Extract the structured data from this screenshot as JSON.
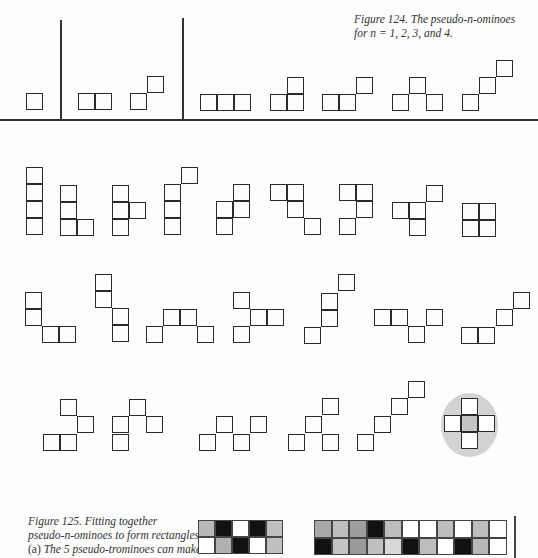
{
  "figure124": {
    "caption_line1": "Figure 124. The pseudo-n-ominoes",
    "caption_line2": "for n = 1, 2, 3, and 4.",
    "groups": [
      {
        "n": 1,
        "pieces": [
          [
            [
              26,
              93
            ]
          ]
        ]
      },
      {
        "n": 2,
        "pieces": [
          [
            [
              78,
              93
            ],
            [
              95,
              93
            ]
          ],
          [
            [
              130,
              93
            ],
            [
              147,
              76
            ]
          ]
        ]
      },
      {
        "n": 3,
        "pieces": [
          [
            [
              200,
              94
            ],
            [
              217,
              94
            ],
            [
              234,
              94
            ]
          ],
          [
            [
              270,
              94
            ],
            [
              287,
              94
            ],
            [
              287,
              77
            ]
          ],
          [
            [
              322,
              94
            ],
            [
              339,
              94
            ],
            [
              356,
              77
            ]
          ],
          [
            [
              392,
              94
            ],
            [
              409,
              77
            ],
            [
              426,
              94
            ]
          ],
          [
            [
              462,
              94
            ],
            [
              479,
              77
            ],
            [
              496,
              60
            ]
          ]
        ]
      }
    ],
    "tetrominoes_row1": [
      [
        [
          26,
          167
        ],
        [
          26,
          184
        ],
        [
          26,
          201
        ],
        [
          26,
          218
        ]
      ],
      [
        [
          60,
          185
        ],
        [
          60,
          202
        ],
        [
          60,
          219
        ],
        [
          77,
          219
        ]
      ],
      [
        [
          112,
          185
        ],
        [
          112,
          202
        ],
        [
          112,
          219
        ],
        [
          129,
          202
        ]
      ],
      [
        [
          164,
          184
        ],
        [
          164,
          201
        ],
        [
          164,
          218
        ],
        [
          181,
          167
        ]
      ],
      [
        [
          216,
          201
        ],
        [
          216,
          218
        ],
        [
          233,
          184
        ],
        [
          233,
          201
        ]
      ],
      [
        [
          270,
          184
        ],
        [
          287,
          184
        ],
        [
          287,
          201
        ],
        [
          304,
          218
        ]
      ],
      [
        [
          339,
          184
        ],
        [
          356,
          184
        ],
        [
          356,
          201
        ],
        [
          339,
          218
        ]
      ],
      [
        [
          392,
          202
        ],
        [
          409,
          202
        ],
        [
          409,
          219
        ],
        [
          426,
          185
        ]
      ],
      [
        [
          462,
          203
        ],
        [
          479,
          203
        ],
        [
          462,
          220
        ],
        [
          479,
          220
        ]
      ]
    ],
    "tetrominoes_row2": [
      [
        [
          25,
          292
        ],
        [
          25,
          309
        ],
        [
          42,
          326
        ],
        [
          59,
          326
        ]
      ],
      [
        [
          95,
          274
        ],
        [
          95,
          291
        ],
        [
          112,
          308
        ],
        [
          112,
          325
        ]
      ],
      [
        [
          146,
          326
        ],
        [
          163,
          309
        ],
        [
          180,
          309
        ],
        [
          197,
          326
        ]
      ],
      [
        [
          233,
          292
        ],
        [
          250,
          309
        ],
        [
          233,
          326
        ],
        [
          267,
          309
        ]
      ],
      [
        [
          304,
          327
        ],
        [
          321,
          310
        ],
        [
          321,
          293
        ],
        [
          338,
          274
        ]
      ],
      [
        [
          374,
          309
        ],
        [
          391,
          309
        ],
        [
          408,
          326
        ],
        [
          426,
          309
        ]
      ],
      [
        [
          461,
          327
        ],
        [
          478,
          327
        ],
        [
          496,
          309
        ],
        [
          513,
          292
        ]
      ]
    ],
    "tetrominoes_row3": [
      [
        [
          60,
          399
        ],
        [
          77,
          416
        ],
        [
          43,
          434
        ],
        [
          60,
          434
        ]
      ],
      [
        [
          129,
          399
        ],
        [
          112,
          416
        ],
        [
          146,
          416
        ],
        [
          112,
          434
        ]
      ],
      [
        [
          216,
          416
        ],
        [
          199,
          434
        ],
        [
          233,
          434
        ],
        [
          250,
          416
        ]
      ],
      [
        [
          322,
          398
        ],
        [
          305,
          416
        ],
        [
          288,
          434
        ],
        [
          322,
          434
        ]
      ],
      [
        [
          408,
          381
        ],
        [
          391,
          398
        ],
        [
          374,
          416
        ],
        [
          357,
          434
        ]
      ]
    ],
    "highlighted_piece": {
      "cells": [
        [
          461,
          398
        ],
        [
          444,
          415
        ],
        [
          461,
          415
        ],
        [
          478,
          415
        ],
        [
          461,
          432
        ]
      ],
      "halo_color": "#d3d3d3",
      "center_fill": "#c4c4c4"
    }
  },
  "figure125": {
    "caption_line1": "Figure 125. Fitting together",
    "caption_line2": "pseudo-n-ominoes to form rectangles:",
    "caption_line3_prefix": "(a)",
    "caption_line3": " The 5 pseudo-trominoes can make",
    "rect_a": {
      "x": 198,
      "y": 520,
      "cols": 5,
      "rows": 2,
      "cell": 17,
      "fills": [
        [
          "#b8b8b8",
          "#111111",
          "#ffffff",
          "#111111",
          "#c0c0c0"
        ],
        [
          "#ffffff",
          "#b0b0b0",
          "#111111",
          "#ffffff",
          "#c0c0c0"
        ]
      ]
    },
    "rect_b": {
      "x": 314,
      "y": 520,
      "cols": 11,
      "rows": 2,
      "cell": 17.5,
      "fills": [
        [
          "#a8a8a8",
          "#bdbdbd",
          "#9e9e9e",
          "#111111",
          "#bdbdbd",
          "#ffffff",
          "#ffffff",
          "#bdbdbd",
          "#ffffff",
          "#bdbdbd",
          "#ffffff"
        ],
        [
          "#111111",
          "#c4c4c4",
          "#9a9a9a",
          "#c0c0c0",
          "#d8d8d8",
          "#111111",
          "#bdbdbd",
          "#ffffff",
          "#111111",
          "#b8b8b8",
          "#ffffff"
        ]
      ]
    }
  }
}
